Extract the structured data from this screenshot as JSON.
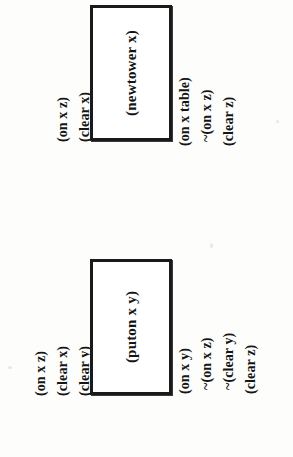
{
  "figure": {
    "type": "strips-operator-diagram",
    "orientation": "rotated-90-ccw",
    "background_color": "#fdfdfc",
    "ink_color": "#151515",
    "box_border_color": "#1a1a1a"
  },
  "operators": [
    {
      "name": "newtower-operator",
      "box_label": "(newtower x)",
      "preconditions": [
        "(on x z)",
        "(clear x)"
      ],
      "effects": [
        "(on x table)",
        "~(on x z)",
        "(clear z)"
      ]
    },
    {
      "name": "puton-operator",
      "box_label": "(puton x y)",
      "preconditions": [
        "(on x z)",
        "(clear x)",
        "(clear y)"
      ],
      "effects": [
        "(on x y)",
        "~(on x z)",
        "~(clear y)",
        "(clear z)"
      ]
    }
  ]
}
